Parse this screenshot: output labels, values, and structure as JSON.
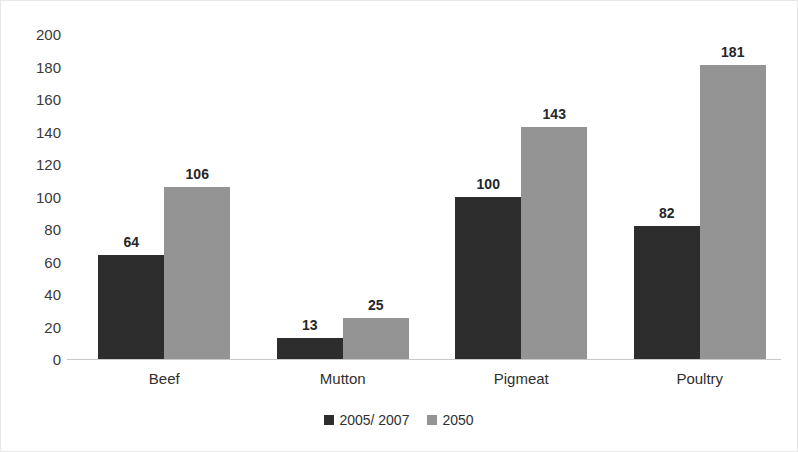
{
  "chart_data": {
    "type": "bar",
    "title": "",
    "subtitle": "",
    "xlabel": "",
    "ylabel": "",
    "ylim": [
      0,
      200
    ],
    "ytick_step": 20,
    "yticks": [
      "200",
      "180",
      "160",
      "140",
      "120",
      "100",
      "80",
      "60",
      "40",
      "20",
      "0"
    ],
    "grid": false,
    "legend_position": "bottom-center",
    "categories": [
      "Beef",
      "Mutton",
      "Pigmeat",
      "Poultry"
    ],
    "series": [
      {
        "name": "2005/ 2007",
        "color": "#2d2d2d",
        "values": [
          64,
          13,
          100,
          82
        ],
        "labels": [
          "64",
          "13",
          "100",
          "82"
        ]
      },
      {
        "name": "2050",
        "color": "#949494",
        "values": [
          106,
          25,
          143,
          181
        ],
        "labels": [
          "106",
          "25",
          "143",
          "181"
        ]
      }
    ]
  },
  "legend": {
    "items": [
      {
        "label": "2005/ 2007",
        "swatch": "dark-square-swatch"
      },
      {
        "label": "2050",
        "swatch": "gray-square-swatch"
      }
    ]
  },
  "colors": {
    "series_2005_2007": "#2d2d2d",
    "series_2050": "#949494",
    "axis": "#c9c9c9",
    "text": "#2f2f2f",
    "background": "#ffffff",
    "border": "#e8e8e8"
  }
}
